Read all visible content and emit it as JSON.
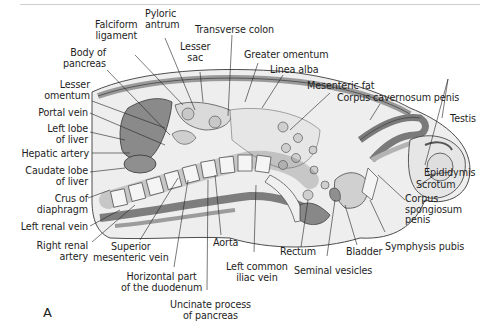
{
  "figure": {
    "panel_letter": "A",
    "colors": {
      "dark_tissue": "#8a8a8a",
      "mid_tissue": "#b5b5b5",
      "light_tissue": "#dcdcdc",
      "bone": "#f4f4f4",
      "outline": "#3a3a3a"
    }
  },
  "labels": {
    "falciform_ligament": [
      "Falciform",
      "ligament"
    ],
    "pyloric_antrum": [
      "Pyloric",
      "antrum"
    ],
    "transverse_colon": "Transverse colon",
    "body_of_pancreas": [
      "Body of",
      "pancreas"
    ],
    "lesser_sac": [
      "Lesser",
      "sac"
    ],
    "greater_omentum": "Greater omentum",
    "linea_alba": "Linea alba",
    "lesser_omentum": [
      "Lesser",
      "omentum"
    ],
    "mesenteric_fat": "Mesenteric fat",
    "corpus_cavernosum_penis": "Corpus cavernosum penis",
    "portal_vein": "Portal vein",
    "testis": "Testis",
    "left_lobe_of_liver": [
      "Left lobe",
      "of liver"
    ],
    "hepatic_artery": "Hepatic artery",
    "caudate_lobe_of_liver": [
      "Caudate lobe",
      "of liver"
    ],
    "epididymis": "Epididymis",
    "scrotum": "Scrotum",
    "crus_of_diaphragm": [
      "Crus of",
      "diaphragm"
    ],
    "corpus_spongiosum_penis": [
      "Corpus",
      "spongiosum",
      "penis"
    ],
    "left_renal_vein": "Left renal vein",
    "symphysis_pubis": "Symphysis pubis",
    "right_renal_artery": [
      "Right renal",
      "artery"
    ],
    "aorta": "Aorta",
    "rectum": "Rectum",
    "bladder": "Bladder",
    "superior_mesenteric_vein": [
      "Superior",
      "mesenteric vein"
    ],
    "seminal_vesicles": "Seminal vesicles",
    "left_common_iliac_vein": [
      "Left common",
      "iliac vein"
    ],
    "horizontal_part_duodenum": [
      "Horizontal part",
      "of the duodenum"
    ],
    "uncinate_process_pancreas": [
      "Uncinate process",
      "of pancreas"
    ]
  }
}
